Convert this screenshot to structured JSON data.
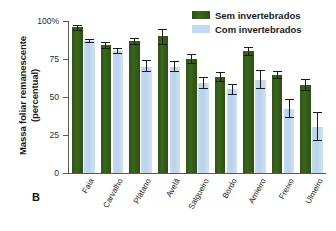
{
  "panel": {
    "letter": "B"
  },
  "legend": {
    "position": "top-right",
    "items": [
      {
        "label": "Sem invertebrados",
        "color": "#2f5314",
        "swatch": "green"
      },
      {
        "label": "Com invertebrados",
        "color": "#c3daf0",
        "swatch": "blue"
      }
    ]
  },
  "axes": {
    "ylabel": "Massa foliar remanescente\n(percentual)",
    "ytick_labels": [
      "100%",
      "75",
      "50",
      "25",
      "0"
    ],
    "ytick_values": [
      100,
      75,
      50,
      25,
      0
    ]
  },
  "chart_data": {
    "type": "bar",
    "title": "",
    "xlabel": "",
    "ylabel": "Massa foliar remanescente (percentual)",
    "ylim": [
      0,
      100
    ],
    "grid": false,
    "legend_position": "top-right",
    "categories": [
      "Faia",
      "Carvalho",
      "Plátano",
      "Avelã",
      "Salgueiro",
      "Bordo",
      "Amieiro",
      "Freixo",
      "Ulmeiro"
    ],
    "series": [
      {
        "name": "Sem invertebrados",
        "color": "#2f5314",
        "values": [
          96,
          84,
          87,
          90,
          75,
          63,
          80,
          64.5,
          58
        ],
        "err_low": [
          93.5,
          81.5,
          84.5,
          84,
          71.5,
          60,
          77,
          62,
          54
        ],
        "err_high": [
          97.5,
          86,
          89,
          95,
          78,
          66.5,
          83,
          67,
          62
        ]
      },
      {
        "name": "Com invertebrados",
        "color": "#c3daf0",
        "values": [
          87,
          80,
          70,
          70,
          59,
          55,
          61,
          42,
          30
        ],
        "err_low": [
          85.5,
          78.5,
          66.5,
          66.5,
          55,
          51.5,
          55,
          36.5,
          21
        ],
        "err_high": [
          88.5,
          82,
          74.5,
          73.5,
          63,
          58.5,
          68,
          49,
          40
        ]
      }
    ]
  }
}
